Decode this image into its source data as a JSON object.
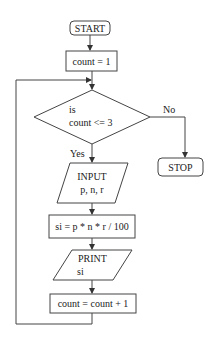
{
  "flowchart": {
    "start": "START",
    "init": "count = 1",
    "decision": {
      "line1": "is",
      "line2": "count <= 3"
    },
    "yes_label": "Yes",
    "no_label": "No",
    "stop": "STOP",
    "input": {
      "line1": "INPUT",
      "line2": "p, n, r"
    },
    "compute": "si = p * n * r / 100",
    "print": {
      "line1": "PRINT",
      "line2": "si"
    },
    "increment": "count = count + 1"
  },
  "colors": {
    "stroke": "#333333",
    "background": "#ffffff"
  }
}
